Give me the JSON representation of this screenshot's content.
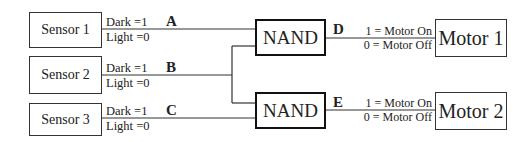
{
  "sensors": [
    {
      "label": "Sensor 1",
      "dark": "Dark =1",
      "light": "Light =0",
      "signal": "A"
    },
    {
      "label": "Sensor 2",
      "dark": "Dark =1",
      "light": "Light =0",
      "signal": "B"
    },
    {
      "label": "Sensor 3",
      "dark": "Dark =1",
      "light": "Light =0",
      "signal": "C"
    }
  ],
  "gates": [
    {
      "label": "NAND",
      "output_signal": "D"
    },
    {
      "label": "NAND",
      "output_signal": "E"
    }
  ],
  "motors": [
    {
      "label": "Motor 1",
      "on": "1 = Motor On",
      "off": "0 = Motor Off"
    },
    {
      "label": "Motor 2",
      "on": "1 = Motor On",
      "off": "0 = Motor Off"
    }
  ]
}
